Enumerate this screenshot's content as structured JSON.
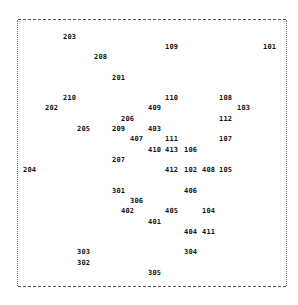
{
  "labels": [
    {
      "text": "203",
      "x": 63,
      "y": 33
    },
    {
      "text": "109",
      "x": 165,
      "y": 43
    },
    {
      "text": "101",
      "x": 263,
      "y": 43
    },
    {
      "text": "208",
      "x": 94,
      "y": 53
    },
    {
      "text": "201",
      "x": 112,
      "y": 74
    },
    {
      "text": "210",
      "x": 63,
      "y": 94
    },
    {
      "text": "110",
      "x": 165,
      "y": 94
    },
    {
      "text": "108",
      "x": 219,
      "y": 94
    },
    {
      "text": "202",
      "x": 45,
      "y": 104
    },
    {
      "text": "409",
      "x": 148,
      "y": 104
    },
    {
      "text": "103",
      "x": 237,
      "y": 104
    },
    {
      "text": "206",
      "x": 121,
      "y": 115
    },
    {
      "text": "112",
      "x": 219,
      "y": 115
    },
    {
      "text": "205",
      "x": 77,
      "y": 125
    },
    {
      "text": "209",
      "x": 112,
      "y": 125
    },
    {
      "text": "403",
      "x": 148,
      "y": 125
    },
    {
      "text": "407",
      "x": 130,
      "y": 135
    },
    {
      "text": "111",
      "x": 165,
      "y": 135
    },
    {
      "text": "107",
      "x": 219,
      "y": 135
    },
    {
      "text": "410",
      "x": 148,
      "y": 146
    },
    {
      "text": "413",
      "x": 165,
      "y": 146
    },
    {
      "text": "106",
      "x": 184,
      "y": 146
    },
    {
      "text": "207",
      "x": 112,
      "y": 156
    },
    {
      "text": "204",
      "x": 23,
      "y": 166
    },
    {
      "text": "412",
      "x": 165,
      "y": 166
    },
    {
      "text": "102",
      "x": 184,
      "y": 166
    },
    {
      "text": "408",
      "x": 202,
      "y": 166
    },
    {
      "text": "105",
      "x": 219,
      "y": 166
    },
    {
      "text": "301",
      "x": 112,
      "y": 187
    },
    {
      "text": "406",
      "x": 184,
      "y": 187
    },
    {
      "text": "306",
      "x": 130,
      "y": 197
    },
    {
      "text": "402",
      "x": 121,
      "y": 207
    },
    {
      "text": "405",
      "x": 165,
      "y": 207
    },
    {
      "text": "104",
      "x": 202,
      "y": 207
    },
    {
      "text": "401",
      "x": 148,
      "y": 218
    },
    {
      "text": "404",
      "x": 184,
      "y": 228
    },
    {
      "text": "411",
      "x": 202,
      "y": 228
    },
    {
      "text": "303",
      "x": 77,
      "y": 248
    },
    {
      "text": "304",
      "x": 184,
      "y": 248
    },
    {
      "text": "302",
      "x": 77,
      "y": 259
    },
    {
      "text": "305",
      "x": 148,
      "y": 269
    }
  ]
}
